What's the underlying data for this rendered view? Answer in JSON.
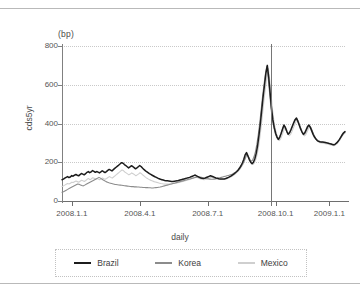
{
  "figure": {
    "unit_label": "(bp)",
    "x_axis_title": "daily",
    "y_axis_title": "cds5yr"
  },
  "legend": {
    "items": [
      {
        "label": "Brazil",
        "color": "#1c1c1c"
      },
      {
        "label": "Korea",
        "color": "#8c8c8c"
      },
      {
        "label": "Mexico",
        "color": "#cfcfcf"
      }
    ]
  },
  "chart_data": {
    "type": "line",
    "title": "",
    "subtitle": "",
    "xlabel": "daily",
    "ylabel": "cds5yr",
    "unit": "(bp)",
    "grid": true,
    "legend_position": "bottom",
    "ylim": [
      0,
      800
    ],
    "yticks": [
      0,
      200,
      400,
      600,
      800
    ],
    "xticks": [
      "2008.1.1",
      "2008.4.1",
      "2008.7.1",
      "2008.10.1",
      "2009.1.1"
    ],
    "xtick_positions_frac": [
      0.035,
      0.275,
      0.515,
      0.755,
      0.945
    ],
    "xlim_labels": [
      "2008.1.1",
      "2009.2.15"
    ],
    "annotations": [
      {
        "type": "vertical-line",
        "x_frac": 0.74,
        "label": ""
      }
    ],
    "series": [
      {
        "name": "Brazil",
        "color": "#1c1c1c",
        "values": [
          110,
          113,
          118,
          122,
          126,
          121,
          124,
          131,
          128,
          133,
          137,
          133,
          130,
          136,
          142,
          139,
          135,
          141,
          148,
          152,
          146,
          150,
          157,
          153,
          148,
          152,
          149,
          145,
          150,
          156,
          151,
          147,
          152,
          158,
          163,
          159,
          155,
          162,
          168,
          174,
          180,
          186,
          192,
          198,
          195,
          188,
          183,
          177,
          171,
          176,
          182,
          178,
          172,
          166,
          171,
          177,
          183,
          178,
          170,
          163,
          157,
          151,
          146,
          141,
          137,
          133,
          129,
          125,
          122,
          118,
          115,
          112,
          110,
          108,
          106,
          105,
          104,
          103,
          102,
          101,
          101,
          102,
          103,
          104,
          106,
          108,
          110,
          112,
          114,
          116,
          118,
          120,
          122,
          125,
          128,
          131,
          134,
          130,
          126,
          122,
          119,
          117,
          116,
          118,
          121,
          124,
          127,
          130,
          128,
          125,
          122,
          119,
          117,
          115,
          114,
          113,
          113,
          114,
          116,
          119,
          122,
          126,
          130,
          135,
          140,
          146,
          152,
          160,
          170,
          182,
          196,
          214,
          238,
          250,
          232,
          214,
          200,
          192,
          200,
          218,
          246,
          286,
          340,
          400,
          470,
          540,
          600,
          660,
          700,
          640,
          560,
          480,
          420,
          380,
          350,
          330,
          318,
          330,
          350,
          372,
          392,
          380,
          360,
          345,
          352,
          368,
          386,
          404,
          420,
          428,
          412,
          392,
          372,
          356,
          344,
          352,
          368,
          384,
          392,
          380,
          362,
          344,
          330,
          320,
          312,
          308,
          306,
          305,
          304,
          303,
          302,
          300,
          298,
          296,
          294,
          292,
          290,
          294,
          300,
          308,
          318,
          330,
          342,
          352,
          358
        ]
      },
      {
        "name": "Korea",
        "color": "#8c8c8c",
        "values": [
          45,
          48,
          52,
          56,
          60,
          64,
          68,
          72,
          76,
          80,
          84,
          88,
          86,
          83,
          80,
          78,
          82,
          86,
          90,
          94,
          98,
          102,
          106,
          110,
          114,
          118,
          122,
          118,
          113,
          108,
          104,
          100,
          97,
          94,
          92,
          90,
          88,
          86,
          85,
          84,
          83,
          82,
          81,
          80,
          79,
          78,
          77,
          76,
          75,
          74,
          74,
          73,
          73,
          72,
          72,
          71,
          71,
          70,
          70,
          69,
          69,
          68,
          68,
          67,
          67,
          68,
          69,
          70,
          71,
          72,
          74,
          76,
          78,
          80,
          82,
          84,
          86,
          88,
          90,
          92,
          94,
          96,
          98,
          100,
          102,
          104,
          106,
          108,
          110,
          112,
          114,
          116,
          118,
          120,
          122,
          124,
          126,
          124,
          122,
          120,
          118,
          116,
          115,
          114,
          113,
          112,
          112,
          113,
          114,
          116,
          118,
          120,
          122,
          124,
          126,
          128,
          130,
          132,
          134,
          136,
          140,
          144,
          148,
          154,
          160,
          168,
          178,
          190,
          205,
          222,
          242,
          230,
          215,
          205,
          210,
          228,
          254,
          292,
          342,
          400,
          468,
          538,
          598,
          655,
          695,
          635,
          555,
          478,
          418,
          378,
          348,
          328,
          316,
          328,
          348,
          370,
          390,
          378,
          358,
          343,
          350,
          366,
          384,
          402,
          418,
          426,
          410,
          390,
          370,
          354,
          342,
          350,
          366,
          382,
          390,
          378,
          360,
          342,
          328,
          318,
          310,
          306,
          304,
          303,
          302,
          301,
          300,
          298,
          296,
          294,
          292,
          290,
          293,
          299,
          306,
          316,
          328,
          340,
          350,
          356
        ]
      },
      {
        "name": "Mexico",
        "color": "#cfcfcf",
        "values": [
          75,
          78,
          82,
          86,
          90,
          88,
          92,
          97,
          95,
          99,
          103,
          100,
          97,
          102,
          107,
          104,
          101,
          106,
          112,
          116,
          110,
          114,
          120,
          117,
          113,
          116,
          113,
          110,
          114,
          119,
          115,
          112,
          116,
          121,
          126,
          122,
          118,
          124,
          130,
          136,
          142,
          148,
          154,
          160,
          157,
          150,
          145,
          140,
          135,
          139,
          145,
          141,
          136,
          130,
          135,
          140,
          146,
          141,
          134,
          128,
          122,
          117,
          113,
          109,
          106,
          103,
          100,
          98,
          96,
          94,
          92,
          90,
          89,
          88,
          87,
          87,
          87,
          87,
          88,
          89,
          90,
          91,
          92,
          94,
          96,
          98,
          100,
          102,
          104,
          106,
          108,
          110,
          112,
          115,
          118,
          121,
          124,
          121,
          118,
          115,
          113,
          111,
          110,
          112,
          114,
          117,
          120,
          123,
          121,
          119,
          117,
          115,
          113,
          112,
          111,
          111,
          111,
          112,
          114,
          117,
          120,
          124,
          128,
          133,
          138,
          144,
          150,
          158,
          168,
          180,
          193,
          211,
          234,
          246,
          228,
          211,
          197,
          189,
          197,
          214,
          241,
          280,
          333,
          392,
          460,
          528,
          588,
          644,
          684,
          626,
          548,
          470,
          412,
          372,
          343,
          324,
          312,
          324,
          343,
          364,
          384,
          372,
          352,
          337,
          344,
          360,
          378,
          396,
          412,
          420,
          404,
          384,
          364,
          348,
          336,
          344,
          360,
          376,
          384,
          372,
          354,
          336,
          322,
          312,
          305,
          301,
          299,
          298,
          297,
          296,
          295,
          293,
          291,
          289,
          287,
          285,
          288,
          294,
          301,
          311,
          323,
          335,
          345,
          351
        ]
      }
    ]
  }
}
